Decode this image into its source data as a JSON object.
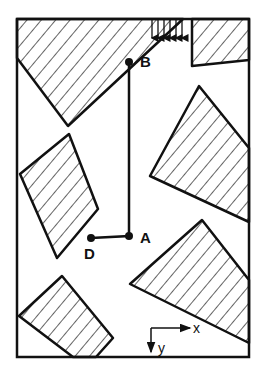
{
  "diagram": {
    "stroke_color": "#111111",
    "background": "#ffffff",
    "points": {
      "A": {
        "label": "A"
      },
      "B": {
        "label": "B"
      },
      "D": {
        "label": "D"
      }
    },
    "axes": {
      "x_label": "x",
      "y_label": "y"
    },
    "regions": [
      {
        "name": "top-left-block"
      },
      {
        "name": "top-right-block"
      },
      {
        "name": "left-middle-block"
      },
      {
        "name": "right-middle-block"
      },
      {
        "name": "bottom-right-block"
      },
      {
        "name": "bottom-left-block"
      }
    ],
    "load_arrows_count": 7
  }
}
